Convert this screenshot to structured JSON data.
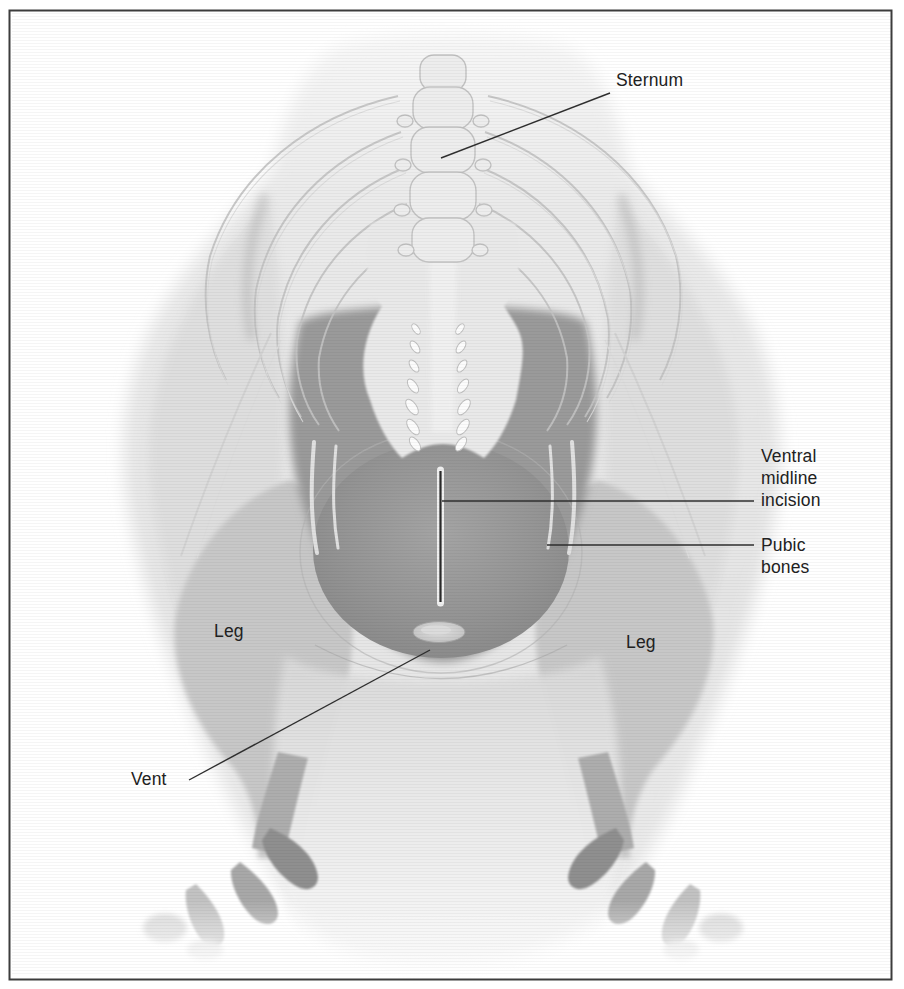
{
  "palette": {
    "background": "#ffffff",
    "frame_border": "#3c3c3c",
    "label_text": "#212121",
    "leader_line": "#2e2e2e",
    "body_light": "#e8e8e8",
    "wing_shade": "#dedede",
    "leg_shade": "#c7c7c7",
    "muscle_dark": "#9a9a9a",
    "abdomen_dark": "#8a8a8a",
    "bone_fill": "#ededed",
    "bone_outline": "#c2c2c2",
    "pubic_bone_light": "#e0e0e0",
    "incision_line": "#2a2a2a"
  },
  "labels": {
    "sternum": {
      "text": "Sternum"
    },
    "ventral_midline_incision": {
      "line1": "Ventral",
      "line2": "midline",
      "line3": "incision"
    },
    "pubic_bones": {
      "line1": "Pubic",
      "line2": "bones"
    },
    "leg_left": {
      "text": "Leg"
    },
    "leg_right": {
      "text": "Leg"
    },
    "vent": {
      "text": "Vent"
    }
  }
}
